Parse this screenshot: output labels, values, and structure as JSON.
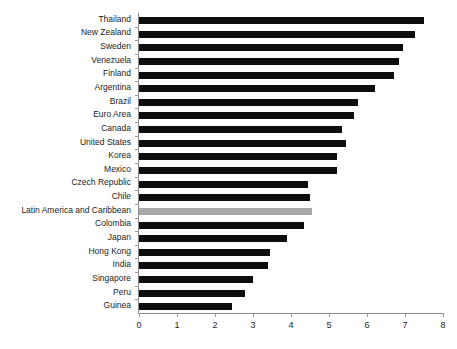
{
  "chart_data": {
    "type": "bar",
    "orientation": "horizontal",
    "title": "",
    "subtitle": "",
    "xlabel": "",
    "ylabel": "",
    "xlim": [
      0,
      8
    ],
    "xticks": [
      0,
      1,
      2,
      3,
      4,
      5,
      6,
      7,
      8
    ],
    "xtick_labels": [
      "0",
      "1",
      "2",
      "3",
      "4",
      "5",
      "6",
      "7",
      "8"
    ],
    "grid": false,
    "legend": false,
    "legend_position": "none",
    "bar_color": "#0d0d0d",
    "highlight_color": "#a9a9a9",
    "highlight_category": "Latin America and Caribbean",
    "categories": [
      "Thailand",
      "New Zealand",
      "Sweden",
      "Venezuela",
      "Finland",
      "Argentina",
      "Brazil",
      "Euro Area",
      "Canada",
      "United States",
      "Korea",
      "Mexico",
      "Czech Republic",
      "Chile",
      "Latin America and Caribbean",
      "Colombia",
      "Japan",
      "Hong Kong",
      "India",
      "Singapore",
      "Peru",
      "Guinea"
    ],
    "values": [
      7.5,
      7.25,
      6.95,
      6.85,
      6.7,
      6.2,
      5.75,
      5.65,
      5.35,
      5.45,
      5.2,
      5.2,
      4.45,
      4.5,
      4.55,
      4.35,
      3.9,
      3.45,
      3.4,
      3.0,
      2.8,
      2.45
    ]
  }
}
